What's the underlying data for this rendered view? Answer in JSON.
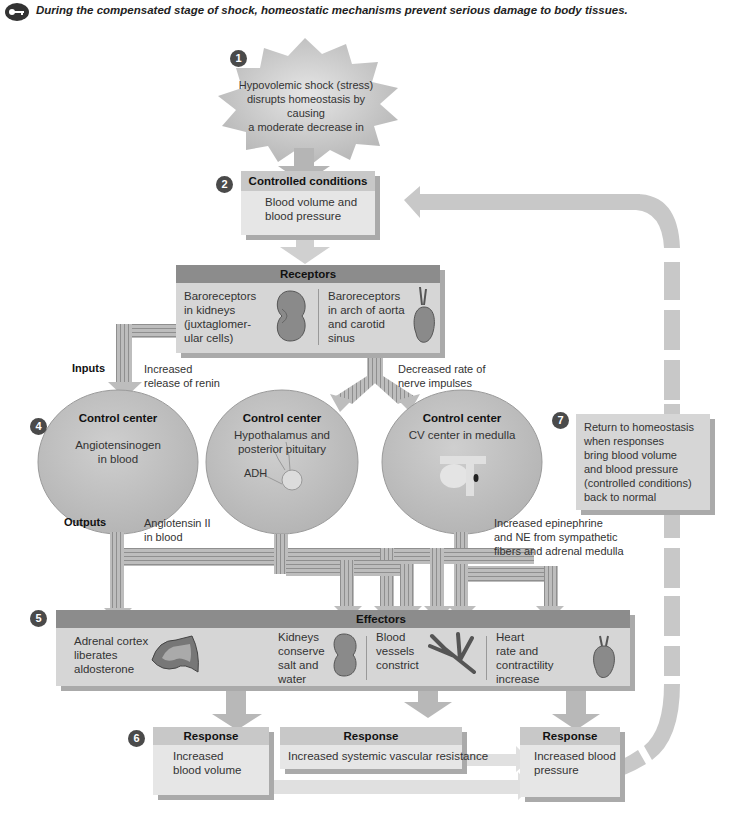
{
  "caption": "During the compensated stage of shock, homeostatic mechanisms prevent serious damage to body tissues.",
  "key_icon": "key-icon",
  "steps": [
    "1",
    "2",
    "3",
    "4",
    "5",
    "6",
    "7"
  ],
  "stress": {
    "text_line1": "Hypovolemic shock (stress)",
    "text_line2": "disrupts homeostasis by causing",
    "text_line3": "a moderate decrease in"
  },
  "controlled_conditions": {
    "title": "Controlled conditions",
    "line1": "Blood volume and",
    "line2": "blood pressure"
  },
  "receptors": {
    "title": "Receptors",
    "left": [
      "Baroreceptors",
      "in kidneys",
      "(juxtaglomer-",
      "ular cells)"
    ],
    "left_icon": "kidney-icon",
    "right": [
      "Baroreceptors",
      "in arch of aorta",
      "and carotid",
      "sinus"
    ],
    "right_icon": "heart-icon"
  },
  "inputs": {
    "label": "Inputs",
    "left_note": [
      "Increased",
      "release of renin"
    ],
    "right_note": [
      "Decreased rate of",
      "nerve impulses"
    ]
  },
  "control_centers": [
    {
      "title": "Control center",
      "body": [
        "Angiotensinogen",
        "in blood"
      ]
    },
    {
      "title": "Control center",
      "body": [
        "Hypothalamus and",
        "posterior pituitary"
      ],
      "label": "ADH",
      "icon": "pituitary-icon"
    },
    {
      "title": "Control center",
      "body": [
        "CV center in medulla"
      ],
      "icon": "brainstem-icon"
    }
  ],
  "outputs": {
    "label": "Outputs",
    "left_note": [
      "Angiotensin II",
      "in blood"
    ],
    "right_note": [
      "Increased epinephrine",
      "and NE from sympathetic",
      "fibers and adrenal medulla"
    ]
  },
  "effectors": {
    "title": "Effectors",
    "items": [
      {
        "text": [
          "Adrenal cortex",
          "liberates",
          "aldosterone"
        ],
        "icon": "adrenal-cortex-icon"
      },
      {
        "text": [
          "Kidneys",
          "conserve",
          "salt and",
          "water"
        ],
        "icon": "kidney-icon"
      },
      {
        "text": [
          "Blood",
          "vessels",
          "constrict"
        ],
        "icon": "blood-vessel-icon"
      },
      {
        "text": [
          "Heart",
          "rate and",
          "contractility",
          "increase"
        ],
        "icon": "heart-icon"
      }
    ]
  },
  "responses": [
    {
      "title": "Response",
      "body": [
        "Increased",
        "blood volume"
      ]
    },
    {
      "title": "Response",
      "body": [
        "Increased systemic vascular resistance"
      ]
    },
    {
      "title": "Response",
      "body": [
        "Increased blood",
        "pressure"
      ]
    }
  ],
  "return_homeostasis": [
    "Return to homeostasis",
    "when responses",
    "bring blood volume",
    "and blood pressure",
    "(controlled conditions)",
    "back to normal"
  ],
  "colors": {
    "header_dark": "#8c8c8c",
    "box_body": "#d6d6d6",
    "ellipse": "#c4c4c4",
    "pipe": "#b8b8b8",
    "loop": "#c8c8c8"
  }
}
